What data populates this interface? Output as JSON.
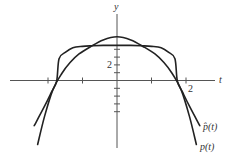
{
  "chart_data": {
    "type": "line",
    "title": "",
    "xlabel": "t",
    "ylabel": "y",
    "xlim": [
      -3.1,
      2.85
    ],
    "ylim": [
      -10.2,
      9.0
    ],
    "grid": false,
    "x_ticks": [
      -2,
      -1,
      1,
      2
    ],
    "x_tick_labels": [
      {
        "value": 2,
        "text": "2"
      }
    ],
    "y_ticks": [
      -4,
      -3,
      -2,
      -1,
      1,
      2,
      3,
      4
    ],
    "y_tick_labels": [
      {
        "value": 2,
        "text": "2"
      }
    ],
    "series": [
      {
        "name": "p̂(t)",
        "label": "p̂(t)",
        "t": [
          -2.4,
          -2.1,
          -1.9,
          -1.75,
          -1.68,
          -1.5,
          -1.28,
          -1.0,
          -0.72,
          -0.4,
          0,
          0.4,
          0.72,
          1.0,
          1.28,
          1.5,
          1.68,
          1.75,
          1.9,
          2.1,
          2.4
        ],
        "y": [
          -5.8,
          -3.3,
          -1.5,
          -0.1,
          2.8,
          3.6,
          4.2,
          4.38,
          4.45,
          4.5,
          4.5,
          4.5,
          4.45,
          4.38,
          4.2,
          3.6,
          2.8,
          -0.1,
          -1.5,
          -3.3,
          -5.8
        ]
      },
      {
        "name": "p(t)",
        "label": "p(t)",
        "t": [
          -2.3,
          -2.1,
          -1.86,
          -1.6,
          -1.36,
          -1.1,
          -0.78,
          -0.4,
          0,
          0.4,
          0.78,
          1.1,
          1.36,
          1.6,
          1.86,
          2.1,
          2.3
        ],
        "y": [
          -8.2,
          -4.6,
          -1.2,
          0.9,
          2.3,
          3.4,
          4.3,
          5.2,
          5.6,
          5.2,
          4.3,
          3.4,
          2.3,
          0.9,
          -1.2,
          -4.6,
          -8.2
        ]
      }
    ]
  }
}
